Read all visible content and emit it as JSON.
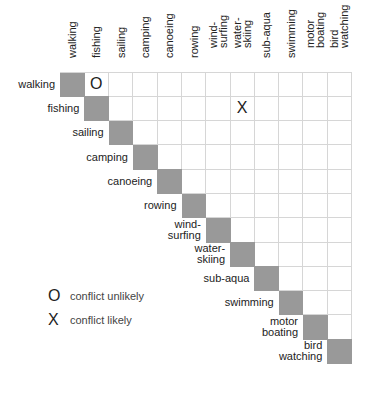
{
  "activities": [
    "walking",
    "fishing",
    "sailing",
    "camping",
    "canoeing",
    "rowing",
    "wind-\nsurfing",
    "water-\nskiing",
    "sub-aqua",
    "swimming",
    "motor\nboating",
    "bird\nwatching"
  ],
  "matrix_marks": [
    {
      "row": 0,
      "col": 1,
      "symbol": "O"
    },
    {
      "row": 1,
      "col": 7,
      "symbol": "X"
    }
  ],
  "legend": [
    {
      "symbol": "O",
      "label": "conflict unlikely"
    },
    {
      "symbol": "X",
      "label": "conflict likely"
    }
  ],
  "colors": {
    "diagonal": "#999999",
    "grid": "#d6d6d6"
  }
}
